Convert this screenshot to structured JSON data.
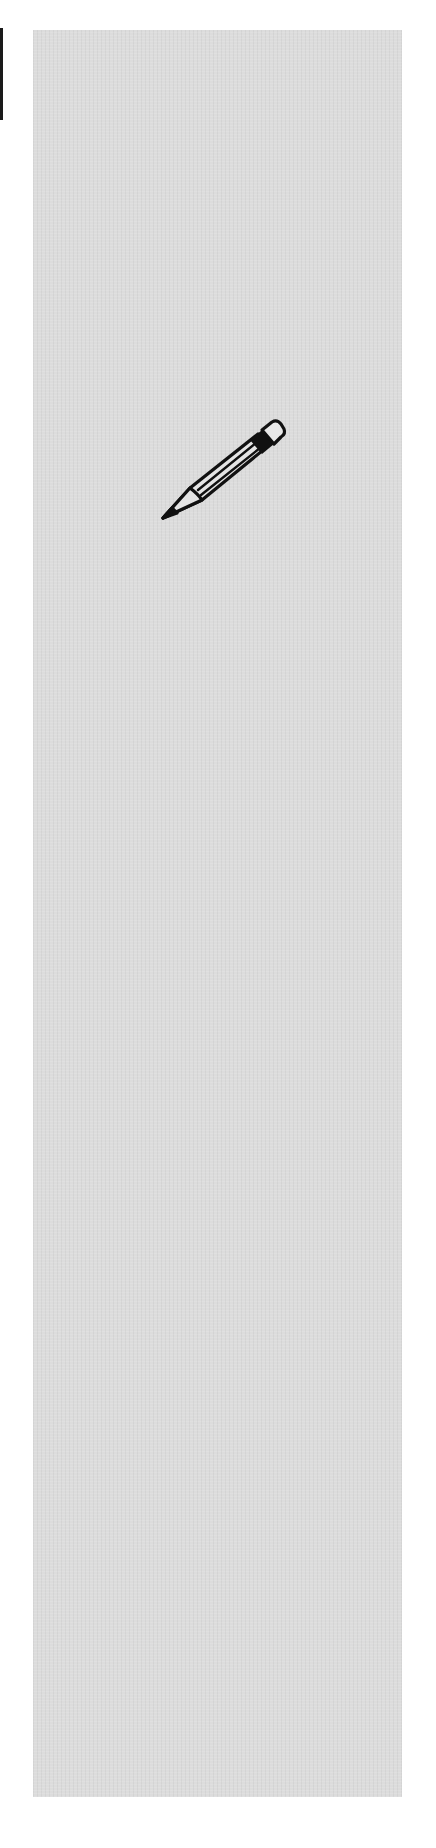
{
  "page": {
    "background": "#ffffff",
    "panel_color": "#dcdcdc",
    "edge_bar_color": "#1a1a1a"
  },
  "illustration": {
    "icon": "pencil-icon",
    "stroke_color": "#111111",
    "orientation": "tip bottom-left, eraser top-right"
  }
}
